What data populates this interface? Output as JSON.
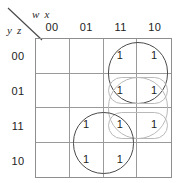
{
  "map": {
    "type": "karnaugh-map",
    "column_variables_label": "w x",
    "row_variables_label": "y z",
    "column_headers": [
      "00",
      "01",
      "11",
      "10"
    ],
    "row_headers": [
      "00",
      "01",
      "11",
      "10"
    ],
    "cells": [
      [
        "",
        "",
        "1",
        "1"
      ],
      [
        "",
        "",
        "1",
        "1"
      ],
      [
        "",
        "1",
        "1",
        "1"
      ],
      [
        "",
        "1",
        "1",
        ""
      ]
    ],
    "groups": [
      {
        "name": "group-top-right-2x2",
        "style": "dark",
        "row_start": 0,
        "row_span": 2,
        "col_start": 2,
        "col_span": 2
      },
      {
        "name": "group-row01-pair",
        "style": "light",
        "row_start": 1,
        "row_span": 1,
        "col_start": 2,
        "col_span": 2
      },
      {
        "name": "group-row11-pair",
        "style": "light",
        "row_start": 2,
        "row_span": 1,
        "col_start": 2,
        "col_span": 2
      },
      {
        "name": "group-middle-right-vertical",
        "style": "light",
        "row_start": 1,
        "row_span": 2,
        "col_start": 2,
        "col_span": 2
      },
      {
        "name": "group-bottom-left-2x2",
        "style": "dark",
        "row_start": 2,
        "row_span": 2,
        "col_start": 1,
        "col_span": 2
      }
    ],
    "colors": {
      "grid_line": "#9a9a9a",
      "grid_border": "#8e8e8e",
      "group_dark": "#4a4a4a",
      "group_light": "#b9b9b9",
      "text": "#1d1d1d"
    }
  }
}
